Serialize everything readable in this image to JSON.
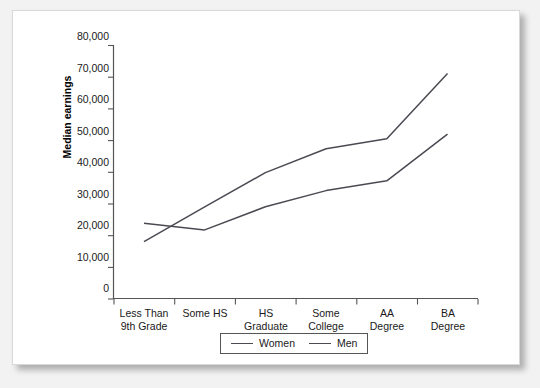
{
  "chart_data": {
    "type": "line",
    "title": "",
    "xlabel": "",
    "ylabel": "Median earnings",
    "ylim": [
      0,
      80000
    ],
    "ytick_values": [
      0,
      10000,
      20000,
      30000,
      40000,
      50000,
      60000,
      70000,
      80000
    ],
    "ytick_labels": [
      "0",
      "10,000",
      "20,000",
      "30,000",
      "40,000",
      "50,000",
      "60,000",
      "70,000",
      "80,000"
    ],
    "categories": [
      {
        "line1": "Less Than",
        "line2": "9th Grade"
      },
      {
        "line1": "Some HS",
        "line2": ""
      },
      {
        "line1": "HS",
        "line2": "Graduate"
      },
      {
        "line1": "Some",
        "line2": "College"
      },
      {
        "line1": "AA",
        "line2": "Degree"
      },
      {
        "line1": "BA",
        "line2": "Degree"
      }
    ],
    "grid": false,
    "legend_position": "bottom-center",
    "series": [
      {
        "name": "Women",
        "color": "#4a4a52",
        "values": [
          23900,
          21800,
          29100,
          34200,
          37300,
          52000
        ]
      },
      {
        "name": "Men",
        "color": "#4a4a52",
        "values": [
          18100,
          29100,
          39900,
          47400,
          50600,
          71200
        ]
      }
    ]
  },
  "legend": {
    "items": [
      {
        "label": "Women"
      },
      {
        "label": "Men"
      }
    ]
  }
}
